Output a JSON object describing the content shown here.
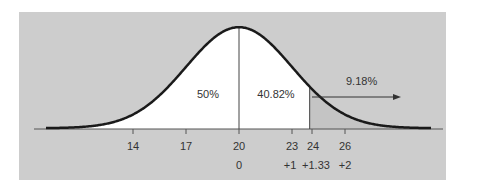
{
  "chart_data": {
    "type": "area",
    "title": "",
    "distribution": {
      "mean": 20,
      "sd": 3
    },
    "x_ticks": [
      14,
      17,
      20,
      23,
      24,
      26
    ],
    "z_ticks": [
      {
        "x": 20,
        "label": "0"
      },
      {
        "x": 23,
        "label": "+1"
      },
      {
        "x": 24,
        "label": "+1.33"
      },
      {
        "x": 26,
        "label": "+2"
      }
    ],
    "regions": [
      {
        "from": null,
        "to": 20,
        "label": "50%",
        "value": 50,
        "fill": "#ffffff"
      },
      {
        "from": 20,
        "to": 24,
        "label": "40.82%",
        "value": 40.82,
        "fill": "#ffffff"
      },
      {
        "from": 24,
        "to": null,
        "label": "9.18%",
        "value": 9.18,
        "fill": "#c6c6c6"
      }
    ],
    "annotations": [
      {
        "text": "9.18%",
        "type": "arrow-right",
        "from_x": 24
      }
    ],
    "xlabel": "",
    "ylabel": "",
    "grid": false,
    "legend": null
  },
  "labels": {
    "pct_left": "50%",
    "pct_mid": "40.82%",
    "pct_right": "9.18%",
    "x14": "14",
    "x17": "17",
    "x20": "20",
    "x23": "23",
    "x24": "24",
    "x26": "26",
    "z0": "0",
    "z1": "+1",
    "z133": "+1.33",
    "z2": "+2"
  },
  "colors": {
    "panel": "#cdcdcd",
    "curve": "#1a1a1a",
    "under_curve": "#ffffff",
    "text": "#333333"
  }
}
